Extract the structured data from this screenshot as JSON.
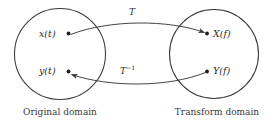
{
  "figure": {
    "type": "mapping-diagram",
    "background_color": "#ffffff",
    "stroke_color": "#3a3a3a",
    "text_color": "#2b2b2b"
  },
  "left_set": {
    "caption": "Original domain",
    "elements": [
      {
        "label": "x(t)",
        "name": "element-x-of-t"
      },
      {
        "label": "y(t)",
        "name": "element-y-of-t"
      }
    ]
  },
  "right_set": {
    "caption": "Transform domain",
    "elements": [
      {
        "label": "X(f)",
        "name": "element-X-of-f"
      },
      {
        "label": "Y(f)",
        "name": "element-Y-of-f"
      }
    ]
  },
  "mappings": {
    "forward": {
      "operator": "T",
      "superscript": "",
      "from": "x(t)",
      "to": "X(f)",
      "direction": "left-to-right"
    },
    "inverse": {
      "operator": "T",
      "superscript": "−1",
      "from": "Y(f)",
      "to": "y(t)",
      "direction": "right-to-left"
    }
  }
}
